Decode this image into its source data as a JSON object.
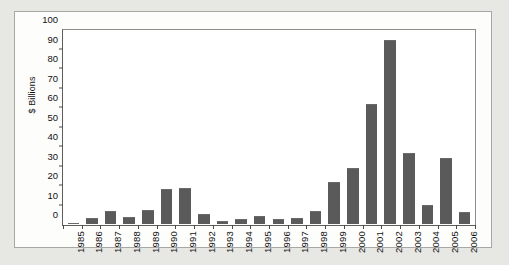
{
  "chart_data": {
    "type": "bar",
    "title": "",
    "subtitle": "",
    "xlabel": "",
    "ylabel": "$ Billions",
    "ylim": [
      0,
      100
    ],
    "ytick_step": 10,
    "yticks": [
      0,
      10,
      20,
      30,
      40,
      50,
      60,
      70,
      80,
      90,
      100
    ],
    "grid": false,
    "legend": null,
    "legend_position": "none",
    "bar_color": "#5a5a5a",
    "background_color": "#ffffff",
    "page_background_color": "#e7e7e4",
    "axis_color": "#4a4a4a",
    "categories": [
      "1985",
      "1986",
      "1987",
      "1988",
      "1989",
      "1990",
      "1991",
      "1992",
      "1993",
      "1994",
      "1995",
      "1996",
      "1997",
      "1998",
      "1999",
      "2000",
      "2001",
      "2002",
      "2003",
      "2004",
      "2005",
      "2006"
    ],
    "values": [
      0.5,
      3,
      7,
      3.5,
      7.5,
      18,
      18.5,
      5,
      1.5,
      2.5,
      4,
      2.5,
      3,
      6.5,
      22,
      29,
      62,
      95.5,
      37,
      10,
      34,
      6
    ],
    "series": [
      {
        "name": "$ Billions",
        "values": [
          0.5,
          3,
          7,
          3.5,
          7.5,
          18,
          18.5,
          5,
          1.5,
          2.5,
          4,
          2.5,
          3,
          6.5,
          22,
          29,
          62,
          95.5,
          37,
          10,
          34,
          6
        ]
      }
    ],
    "annotations": []
  }
}
